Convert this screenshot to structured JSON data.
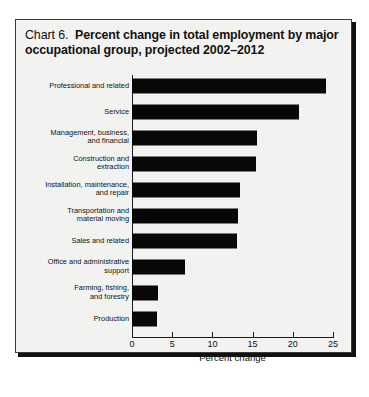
{
  "chart_data": {
    "type": "bar",
    "orientation": "horizontal",
    "title_prefix": "Chart 6.",
    "title": "Percent change in total employment by major occupational group, projected 2002–2012",
    "xlabel": "Percent change",
    "ylabel": "",
    "xlim": [
      0,
      25
    ],
    "xticks": [
      0,
      5,
      10,
      15,
      20,
      25
    ],
    "xtick_labels": [
      "0",
      "5",
      "10",
      "15",
      "20",
      "25"
    ],
    "grid": false,
    "legend": false,
    "bar_color": "#080808",
    "background_color": "#f2f2f0",
    "categories": [
      "Professional and related",
      "Service",
      "Management, business,\nand financial",
      "Construction and\nextraction",
      "Installation, maintenance,\nand repair",
      "Transportation and\nmaterial moving",
      "Sales and related",
      "Office and administrative\nsupport",
      "Farming, fishing,\nand forestry",
      "Production"
    ],
    "values": [
      24.1,
      20.8,
      15.5,
      15.4,
      13.4,
      13.2,
      13.1,
      6.6,
      3.2,
      3.1
    ]
  }
}
